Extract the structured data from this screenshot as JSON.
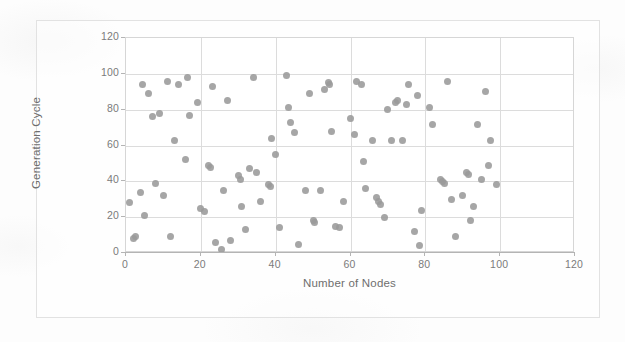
{
  "chart_data": {
    "type": "scatter",
    "title": "",
    "xlabel": "Number of Nodes",
    "ylabel": "Generation Cycle",
    "xlim": [
      0,
      120
    ],
    "ylim": [
      0,
      120
    ],
    "xticks": [
      0,
      20,
      40,
      60,
      80,
      100,
      120
    ],
    "yticks": [
      0,
      20,
      40,
      60,
      80,
      100,
      120
    ],
    "grid": "horizontal-and-vertical",
    "legend": "none",
    "marker": {
      "shape": "circle",
      "color": "#9a9a9a",
      "size": 7
    },
    "series": [
      {
        "name": "Generation Cycle vs Number of Nodes",
        "points": [
          [
            1,
            28
          ],
          [
            2,
            8
          ],
          [
            2.5,
            9
          ],
          [
            4,
            34
          ],
          [
            4.5,
            94
          ],
          [
            5,
            21
          ],
          [
            6,
            89
          ],
          [
            7,
            76
          ],
          [
            8,
            39
          ],
          [
            9,
            78
          ],
          [
            10,
            32
          ],
          [
            11,
            96
          ],
          [
            12,
            9
          ],
          [
            13,
            63
          ],
          [
            14,
            94
          ],
          [
            16,
            52
          ],
          [
            16.5,
            98
          ],
          [
            17,
            77
          ],
          [
            19,
            84
          ],
          [
            20,
            25
          ],
          [
            21,
            23
          ],
          [
            22,
            49
          ],
          [
            22.5,
            48
          ],
          [
            23,
            93
          ],
          [
            24,
            6
          ],
          [
            25.5,
            2
          ],
          [
            26,
            35
          ],
          [
            27,
            85
          ],
          [
            28,
            7
          ],
          [
            30,
            43
          ],
          [
            30.5,
            41
          ],
          [
            31,
            26
          ],
          [
            32,
            13
          ],
          [
            33,
            47
          ],
          [
            34,
            98
          ],
          [
            35,
            45
          ],
          [
            36,
            29
          ],
          [
            38,
            38
          ],
          [
            38.5,
            37
          ],
          [
            39,
            64
          ],
          [
            40,
            55
          ],
          [
            41,
            14
          ],
          [
            43,
            99
          ],
          [
            43.5,
            81
          ],
          [
            44,
            73
          ],
          [
            45,
            67
          ],
          [
            46,
            5
          ],
          [
            48,
            35
          ],
          [
            49,
            89
          ],
          [
            50,
            18
          ],
          [
            50.5,
            17
          ],
          [
            52,
            35
          ],
          [
            53,
            91
          ],
          [
            54,
            95
          ],
          [
            54.5,
            94
          ],
          [
            55,
            68
          ],
          [
            56,
            15
          ],
          [
            57,
            14
          ],
          [
            58,
            29
          ],
          [
            60,
            75
          ],
          [
            61,
            66
          ],
          [
            61.5,
            96
          ],
          [
            63,
            94
          ],
          [
            63.5,
            51
          ],
          [
            64,
            36
          ],
          [
            66,
            63
          ],
          [
            67,
            31
          ],
          [
            67.5,
            29
          ],
          [
            68,
            27
          ],
          [
            69,
            20
          ],
          [
            70,
            80
          ],
          [
            71,
            63
          ],
          [
            72,
            84
          ],
          [
            72.5,
            85
          ],
          [
            74,
            63
          ],
          [
            75,
            83
          ],
          [
            75.5,
            94
          ],
          [
            77,
            12
          ],
          [
            78,
            88
          ],
          [
            78.5,
            4
          ],
          [
            79,
            24
          ],
          [
            81,
            81
          ],
          [
            82,
            72
          ],
          [
            84,
            41
          ],
          [
            84.5,
            40
          ],
          [
            85,
            39
          ],
          [
            86,
            96
          ],
          [
            87,
            30
          ],
          [
            88,
            9
          ],
          [
            90,
            32
          ],
          [
            91,
            45
          ],
          [
            91.5,
            44
          ],
          [
            92,
            18
          ],
          [
            93,
            26
          ],
          [
            94,
            72
          ],
          [
            95,
            41
          ],
          [
            96,
            90
          ],
          [
            97,
            49
          ],
          [
            97.5,
            63
          ],
          [
            99,
            38
          ]
        ]
      }
    ]
  },
  "figure": {
    "accent_color": "#9a9a9a",
    "grid_color": "#dcdcdc",
    "axis_color": "#b4b4b4",
    "text_color": "#7b7b7b"
  }
}
